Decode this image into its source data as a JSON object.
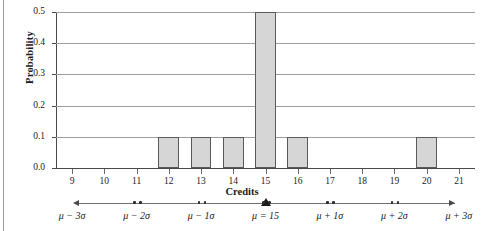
{
  "chart_data": {
    "type": "bar",
    "title": "",
    "xlabel": "Credits",
    "ylabel": "Probability",
    "categories": [
      "9",
      "10",
      "11",
      "12",
      "13",
      "14",
      "15",
      "16",
      "17",
      "18",
      "19",
      "20",
      "21"
    ],
    "values": [
      0,
      0,
      0,
      0.1,
      0.1,
      0.1,
      0.5,
      0.1,
      0,
      0,
      0,
      0.1,
      0
    ],
    "x": [
      9,
      10,
      11,
      12,
      13,
      14,
      15,
      16,
      17,
      18,
      19,
      20,
      21
    ],
    "xlim": [
      8.5,
      21.5
    ],
    "ylim": [
      0.0,
      0.5
    ],
    "y_ticks": [
      "0.0",
      "0.1",
      "0.2",
      "0.3",
      "0.4",
      "0.5"
    ],
    "y_tick_values": [
      0.0,
      0.1,
      0.2,
      0.3,
      0.4,
      0.5
    ],
    "x_ticks": [
      "9",
      "10",
      "11",
      "12",
      "13",
      "14",
      "15",
      "16",
      "17",
      "18",
      "19",
      "20",
      "21"
    ],
    "grid": true,
    "legend": null,
    "bar_color": "#d6d6d6",
    "bar_edge_color": "#5a5a5a",
    "grid_color": "#9e9e9e",
    "axis_color": "#4a4a4a",
    "background": "#ffffff",
    "annotations": {
      "mean": 15,
      "sigma_axis_label": "μ = 15",
      "sigma_ticks": [
        {
          "label": "μ − 3σ",
          "credits": 9
        },
        {
          "label": "μ − 2σ",
          "credits": 11
        },
        {
          "label": "μ − 1σ",
          "credits": 13
        },
        {
          "label": "μ = 15",
          "credits": 15
        },
        {
          "label": "μ + 1σ",
          "credits": 17
        },
        {
          "label": "μ + 2σ",
          "credits": 19
        },
        {
          "label": "μ + 3σ",
          "credits": 21
        }
      ]
    }
  },
  "axis": {
    "y_title": "Probability",
    "x_title": "Credits"
  }
}
